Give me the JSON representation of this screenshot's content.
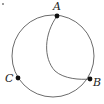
{
  "figure": {
    "kind": "geometry-diagram",
    "background_color": "#ffffff",
    "stroke_color": "#5a5a5a",
    "point_color": "#111111",
    "label_color": "#1c1c1c",
    "stroke_width": 0.9,
    "points": [
      {
        "id": "A",
        "label": "A",
        "x": 57,
        "y": 16,
        "label_x": 53,
        "label_y": 1
      },
      {
        "id": "B",
        "label": "B",
        "x": 90,
        "y": 79,
        "label_x": 93,
        "label_y": 77
      },
      {
        "id": "C",
        "label": "C",
        "x": 18,
        "y": 78,
        "label_x": 5,
        "label_y": 73
      }
    ],
    "circle": {
      "center_x": 53,
      "center_y": 56,
      "radius": 41
    },
    "arcs": [
      {
        "id": "arc-A-to-B",
        "from": "A",
        "to": "B",
        "path": "M 57 16 C 44 34 43 58 55 71 C 64 79 80 80 90 79"
      }
    ],
    "marks": [
      {
        "id": "corner-speck",
        "x": 2,
        "y": 3,
        "size": 2
      }
    ]
  }
}
